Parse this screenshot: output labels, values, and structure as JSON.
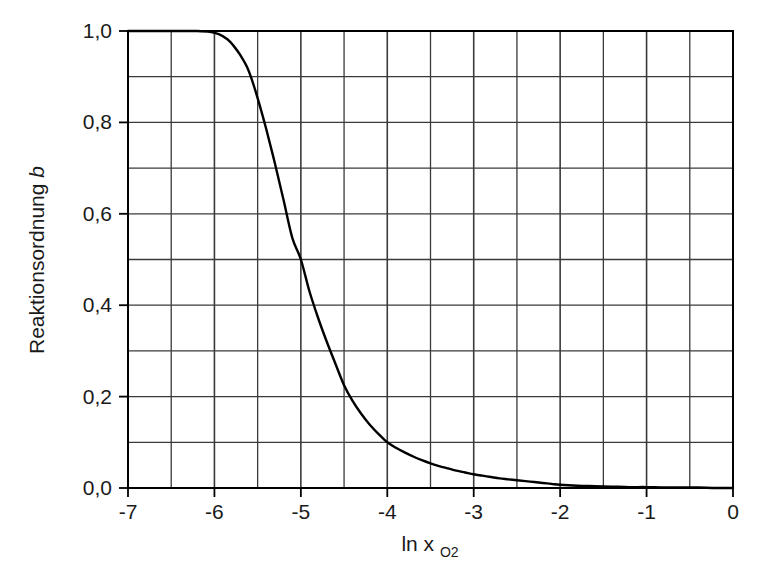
{
  "chart_data": {
    "type": "line",
    "title": "",
    "subtitle": "",
    "xlabel": "ln x",
    "xlabel_sub": "O2",
    "ylabel": "Reaktionsordnung",
    "ylabel_italic": "b",
    "xlim": [
      -7,
      0
    ],
    "ylim": [
      0.0,
      1.0
    ],
    "grid": true,
    "grid_x_step": 0.5,
    "grid_y_step": 0.1,
    "legend": "none",
    "x_ticks": [
      -7,
      -6,
      -5,
      -4,
      -3,
      -2,
      -1,
      0
    ],
    "x_tick_labels": [
      "-7",
      "-6",
      "-5",
      "-4",
      "-3",
      "-2",
      "-1",
      "0"
    ],
    "y_ticks": [
      0.0,
      0.2,
      0.4,
      0.6,
      0.8,
      1.0
    ],
    "y_tick_labels": [
      "0,0",
      "0,2",
      "0,4",
      "0,6",
      "0,8",
      "1,0"
    ],
    "line_color": "#000000",
    "line_width": 2.4,
    "grid_color": "#3a3a3a",
    "axis_color": "#000000",
    "background": "#ffffff",
    "series": [
      {
        "name": "Reaktionsordnung b",
        "x": [
          -7.0,
          -6.8,
          -6.6,
          -6.4,
          -6.2,
          -6.05,
          -5.95,
          -5.85,
          -5.78,
          -5.7,
          -5.62,
          -5.55,
          -5.48,
          -5.4,
          -5.3,
          -5.2,
          -5.1,
          -5.0,
          -4.9,
          -4.8,
          -4.7,
          -4.6,
          -4.5,
          -4.4,
          -4.3,
          -4.2,
          -4.1,
          -4.0,
          -3.9,
          -3.8,
          -3.7,
          -3.6,
          -3.5,
          -3.4,
          -3.3,
          -3.2,
          -3.1,
          -3.0,
          -2.9,
          -2.8,
          -2.7,
          -2.6,
          -2.5,
          -2.4,
          -2.3,
          -2.2,
          -2.1,
          -2.0,
          -1.8,
          -1.6,
          -1.4,
          -1.2,
          -1.0,
          -0.8,
          -0.6,
          -0.4,
          -0.2,
          0.0
        ],
        "y": [
          1.0,
          1.0,
          1.0,
          1.0,
          1.0,
          0.998,
          0.993,
          0.982,
          0.968,
          0.947,
          0.92,
          0.884,
          0.84,
          0.785,
          0.71,
          0.63,
          0.548,
          0.5,
          0.43,
          0.372,
          0.32,
          0.272,
          0.225,
          0.19,
          0.162,
          0.138,
          0.118,
          0.1,
          0.088,
          0.078,
          0.069,
          0.061,
          0.054,
          0.048,
          0.043,
          0.038,
          0.034,
          0.03,
          0.027,
          0.024,
          0.021,
          0.019,
          0.017,
          0.015,
          0.013,
          0.011,
          0.009,
          0.007,
          0.005,
          0.004,
          0.003,
          0.002,
          0.002,
          0.001,
          0.001,
          0.001,
          0.0,
          0.0
        ]
      }
    ]
  },
  "plot_geometry": {
    "left": 128,
    "right": 733,
    "top": 31,
    "bottom": 488
  }
}
